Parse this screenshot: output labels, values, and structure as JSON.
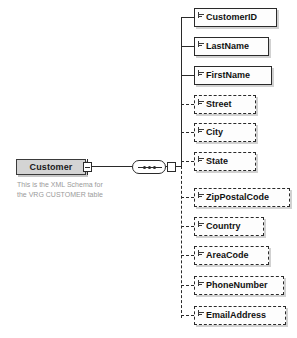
{
  "diagram": {
    "type": "xml-schema-element-tree",
    "root": {
      "name": "Customer",
      "toggle_state": "expanded",
      "toggle_symbol": "-",
      "annotation_line1": "This is the XML Schema for",
      "annotation_line2": "the VRG CUSTOMER table"
    },
    "compositor": {
      "kind": "sequence",
      "toggle_state": "expanded"
    },
    "elements": [
      {
        "name": "CustomerID",
        "occurrence": "required",
        "border": "solid",
        "icon": "simple-type-icon",
        "width": 83
      },
      {
        "name": "LastName",
        "occurrence": "required",
        "border": "solid",
        "icon": "simple-type-icon",
        "width": 75
      },
      {
        "name": "FirstName",
        "occurrence": "required",
        "border": "solid",
        "icon": "simple-type-icon",
        "width": 78
      },
      {
        "name": "Street",
        "occurrence": "optional",
        "border": "dashed",
        "icon": "simple-type-icon",
        "width": 62
      },
      {
        "name": "City",
        "occurrence": "optional",
        "border": "dashed",
        "icon": "simple-type-icon",
        "width": 62
      },
      {
        "name": "State",
        "occurrence": "optional",
        "border": "dashed",
        "icon": "simple-type-icon",
        "width": 62
      },
      {
        "name": "ZipPostalCode",
        "occurrence": "optional",
        "border": "dashed",
        "icon": "simple-type-icon",
        "width": 96
      },
      {
        "name": "Country",
        "occurrence": "optional",
        "border": "dashed",
        "icon": "simple-type-icon",
        "width": 70
      },
      {
        "name": "AreaCode",
        "occurrence": "optional",
        "border": "dashed",
        "icon": "simple-type-icon",
        "width": 75
      },
      {
        "name": "PhoneNumber",
        "occurrence": "optional",
        "border": "dashed",
        "icon": "simple-type-icon",
        "width": 90
      },
      {
        "name": "EmailAddress",
        "occurrence": "optional",
        "border": "dashed",
        "icon": "simple-type-icon",
        "width": 92
      }
    ],
    "colors": {
      "root_fill": "#d4d4d4",
      "box_fill": "#fdfdfd",
      "stroke": "#2a2a2a",
      "annotation_text": "#9a9a9a",
      "label_text": "#111111",
      "background": "#ffffff"
    }
  }
}
